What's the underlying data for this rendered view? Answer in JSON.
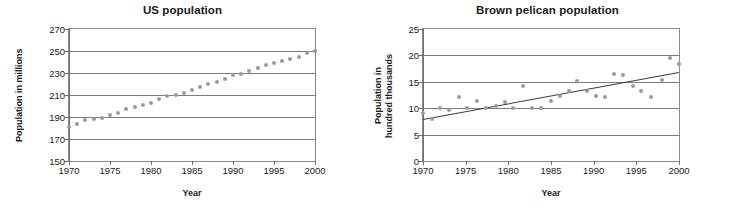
{
  "figure": {
    "panels": [
      {
        "name": "us-population",
        "title": "US population",
        "ylabel": "Population in millions",
        "xlabel": "Year"
      },
      {
        "name": "brown-pelican-population",
        "title": "Brown pelican population",
        "ylabel": "Population in\nhundred thousands",
        "xlabel": "Year"
      }
    ]
  },
  "chart_data": [
    {
      "type": "scatter",
      "name": "us-population",
      "title": "US population",
      "xlabel": "Year",
      "ylabel": "Population in millions",
      "xlim": [
        1970,
        2000
      ],
      "ylim": [
        150,
        270
      ],
      "xticks": [
        1970,
        1975,
        1980,
        1985,
        1990,
        1995,
        2000
      ],
      "yticks": [
        150,
        170,
        190,
        210,
        230,
        250,
        270
      ],
      "grid": "horizontal",
      "legend": "none",
      "marker_color": "#9b9b9b",
      "series": [
        {
          "name": "US population (millions)",
          "x": [
            1970,
            1971,
            1972,
            1973,
            1974,
            1975,
            1976,
            1977,
            1978,
            1979,
            1980,
            1981,
            1982,
            1983,
            1984,
            1985,
            1986,
            1987,
            1988,
            1989,
            1990,
            1991,
            1992,
            1993,
            1994,
            1995,
            1996,
            1997,
            1998,
            1999,
            2000
          ],
          "y": [
            181,
            184,
            187,
            188,
            189,
            192,
            194,
            197,
            199,
            201,
            203,
            206,
            209,
            210,
            212,
            215,
            217,
            220,
            222,
            225,
            228,
            229,
            232,
            235,
            237,
            239,
            241,
            243,
            245,
            248,
            250
          ]
        }
      ]
    },
    {
      "type": "scatter",
      "name": "brown-pelican-population",
      "title": "Brown pelican population",
      "xlabel": "Year",
      "ylabel": "Population in hundred thousands",
      "xlim": [
        1970,
        2000
      ],
      "ylim": [
        0,
        25
      ],
      "xticks": [
        1970,
        1975,
        1980,
        1985,
        1990,
        1995,
        2000
      ],
      "yticks": [
        0,
        5,
        10,
        15,
        20,
        25
      ],
      "grid": "horizontal",
      "legend": "none",
      "marker_color": "#9b9b9b",
      "trendline_color": "#3c3c3c",
      "series": [
        {
          "name": "Brown pelican population (hundred thousands)",
          "x": [
            1970.0,
            1971.0,
            1972.0,
            1973.0,
            1974.2,
            1975.2,
            1976.3,
            1977.4,
            1978.5,
            1979.6,
            1980.6,
            1981.7,
            1982.8,
            1983.8,
            1985.0,
            1986.0,
            1987.1,
            1988.1,
            1989.2,
            1990.3,
            1991.3,
            1992.4,
            1993.4,
            1994.6,
            1995.6,
            1996.7,
            1998.0,
            1999.0,
            2000.0
          ],
          "y": [
            9.0,
            8.0,
            10.1,
            9.7,
            12.1,
            10.1,
            11.3,
            10.0,
            10.5,
            11.2,
            10.0,
            14.2,
            10.0,
            10.1,
            11.3,
            12.3,
            13.2,
            15.2,
            13.3,
            12.3,
            12.2,
            16.4,
            16.3,
            14.2,
            13.3,
            12.2,
            15.3,
            19.5,
            18.4
          ]
        }
      ],
      "trendline": {
        "name": "linear fit",
        "x": [
          1970,
          2000
        ],
        "y": [
          8.0,
          16.9
        ]
      }
    }
  ]
}
